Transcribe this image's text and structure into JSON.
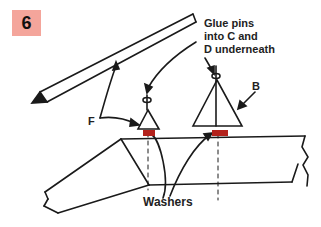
{
  "step": {
    "number": "6",
    "color": "#f4a59b"
  },
  "labels": {
    "glue_line1": "Glue pins",
    "glue_line2": "into C and",
    "glue_line3": "D underneath",
    "b": "B",
    "f": "F",
    "washers": "Washers"
  },
  "colors": {
    "line": "#1a1a1a",
    "washer": "#b3221c"
  }
}
